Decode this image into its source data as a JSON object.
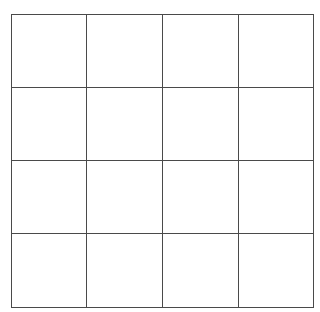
{
  "board": {
    "rows": 4,
    "cols": 4,
    "line_color": "#4a4a4a",
    "background": "#ffffff",
    "cells": [
      [
        "",
        "",
        "",
        ""
      ],
      [
        "",
        "",
        "",
        ""
      ],
      [
        "",
        "",
        "",
        ""
      ],
      [
        "",
        "",
        "",
        ""
      ]
    ]
  }
}
